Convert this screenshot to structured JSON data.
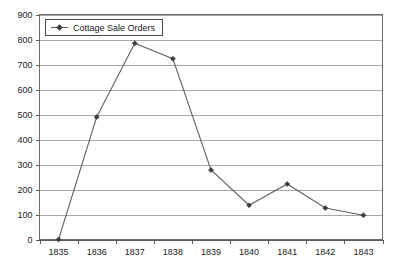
{
  "chart_data": {
    "type": "line",
    "title": "",
    "xlabel": "",
    "ylabel": "",
    "categories": [
      "1835",
      "1836",
      "1837",
      "1838",
      "1839",
      "1840",
      "1841",
      "1842",
      "1843"
    ],
    "series": [
      {
        "name": "Cottage Sale Orders",
        "values": [
          0,
          490,
          785,
          723,
          278,
          137,
          222,
          126,
          97
        ],
        "color": "#636363",
        "marker": "diamond"
      }
    ],
    "ylim": [
      0,
      900
    ],
    "yticks": [
      0,
      100,
      200,
      300,
      400,
      500,
      600,
      700,
      800,
      900
    ],
    "ytick_labels": [
      "0",
      "100",
      "200",
      "300",
      "400",
      "500",
      "600",
      "700",
      "800",
      "900"
    ],
    "xtick_labels": [
      "1835",
      "1836",
      "1837",
      "1838",
      "1839",
      "1840",
      "1841",
      "1842",
      "1843"
    ],
    "grid": "horizontal",
    "legend_position": "top-left",
    "legend_entries": [
      "Cottage Sale Orders"
    ]
  },
  "legend": {
    "entry_label": "Cottage Sale Orders"
  },
  "axes": {
    "y_labels": [
      "900",
      "800",
      "700",
      "600",
      "500",
      "400",
      "300",
      "200",
      "100",
      "0"
    ],
    "x_labels": [
      "1835",
      "1836",
      "1837",
      "1838",
      "1839",
      "1840",
      "1841",
      "1842",
      "1843"
    ]
  }
}
